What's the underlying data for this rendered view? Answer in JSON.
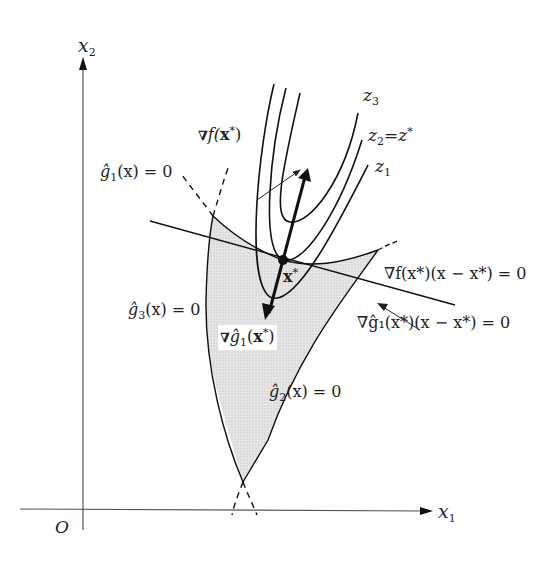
{
  "figure": {
    "axes": {
      "x_label": "x",
      "x_label_sub": "1",
      "y_label": "x",
      "y_label_sub": "2",
      "origin_label": "O"
    },
    "contours": {
      "z3": {
        "name": "z",
        "sub": "3"
      },
      "z2": {
        "name": "z",
        "sub": "2",
        "eq": "=",
        "rhs": "z",
        "rhs_sup": "*"
      },
      "z1": {
        "name": "z",
        "sub": "1"
      }
    },
    "point": {
      "label": "x",
      "sup": "*"
    },
    "gradient_f": {
      "nabla": "∇",
      "text": "f(",
      "x": "x",
      "sup": "*",
      "close": ")"
    },
    "gradient_g1": {
      "nabla": "∇",
      "text": "ĝ",
      "sub": "1",
      "open": "(",
      "x": "x",
      "sup": "*",
      "close": ")"
    },
    "constraints": {
      "g1": {
        "text": "ĝ",
        "sub": "1",
        "arg": "(x) = 0"
      },
      "g2": {
        "text": "ĝ",
        "sub": "2",
        "arg": "(x) = 0"
      },
      "g3": {
        "text": "ĝ",
        "sub": "3",
        "arg": "(x) = 0"
      }
    },
    "tangent_f": {
      "text": "∇f(x*)(x − x*) = 0"
    },
    "tangent_g1": {
      "text": "∇ĝ₁(x*)(x − x*) = 0"
    },
    "colors": {
      "stroke": "#111111",
      "feasible_fill": "#dcdcdc",
      "axis": "#555555"
    }
  }
}
